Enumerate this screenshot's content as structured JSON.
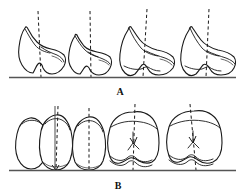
{
  "figure": {
    "type": "scientific-line-drawing",
    "title_visible": false,
    "background_color": "#ffffff",
    "ink_color": "#1a1a1a",
    "baseline_color": "#555555",
    "width_px": 243,
    "height_px": 193,
    "panels": [
      {
        "id": "A",
        "label": "A",
        "label_x": 120,
        "label_y": 92,
        "description": "lateral-outline-row",
        "baseline": {
          "x1": 9,
          "x2": 236,
          "y": 77
        },
        "specimen_count": 4,
        "specimens": [
          {
            "index": 1,
            "name": "specimen-a1",
            "axis": {
              "type": "dashed",
              "x_top": 38,
              "y_top": 11,
              "x_bottom": 41,
              "y_bottom": 77
            }
          },
          {
            "index": 2,
            "name": "specimen-a2",
            "axis": {
              "type": "dashed",
              "x_top": 90,
              "y_top": 11,
              "x_bottom": 91,
              "y_bottom": 77
            }
          },
          {
            "index": 3,
            "name": "specimen-a3",
            "axis": {
              "type": "dashed",
              "x_top": 147,
              "y_top": 9,
              "x_bottom": 143,
              "y_bottom": 77
            }
          },
          {
            "index": 4,
            "name": "specimen-a4",
            "axis": {
              "type": "dashed",
              "x_top": 209,
              "y_top": 9,
              "x_bottom": 206,
              "y_bottom": 77
            }
          }
        ]
      },
      {
        "id": "B",
        "label": "B",
        "label_x": 118,
        "label_y": 186,
        "description": "occlusal-outline-row",
        "baseline": {
          "x1": 9,
          "x2": 236,
          "y": 170
        },
        "specimen_count": 5,
        "specimens": [
          {
            "index": 1,
            "name": "specimen-b1",
            "axis": null
          },
          {
            "index": 2,
            "name": "specimen-b2",
            "axis": {
              "type": "dashed",
              "x_top": 58,
              "y_top": 106,
              "x_bottom": 56,
              "y_bottom": 170
            },
            "extra_axis": {
              "type": "solid",
              "x_top": 55,
              "y_top": 106,
              "x_bottom": 55,
              "y_bottom": 170
            }
          },
          {
            "index": 3,
            "name": "specimen-b3",
            "axis": {
              "type": "dashed",
              "x_top": 89,
              "y_top": 108,
              "x_bottom": 89,
              "y_bottom": 170
            }
          },
          {
            "index": 4,
            "name": "specimen-b4",
            "axis": {
              "type": "dashed",
              "x_top": 135,
              "y_top": 104,
              "x_bottom": 133,
              "y_bottom": 170,
              "arrow": "down"
            }
          },
          {
            "index": 5,
            "name": "specimen-b5",
            "axis": {
              "type": "dashed",
              "x_top": 190,
              "y_top": 104,
              "x_bottom": 196,
              "y_bottom": 170,
              "arrow": "down"
            }
          }
        ]
      }
    ]
  }
}
